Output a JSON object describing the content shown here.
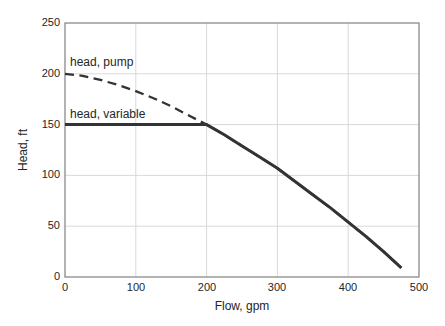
{
  "chart_data": {
    "type": "line",
    "title": "",
    "xlabel": "Flow, gpm",
    "ylabel": "Head, ft",
    "xlim": [
      0,
      500
    ],
    "ylim": [
      0,
      250
    ],
    "xticks": [
      0,
      100,
      200,
      300,
      400,
      500
    ],
    "yticks": [
      0,
      50,
      100,
      150,
      200,
      250
    ],
    "grid": true,
    "legend_position": "none",
    "colors": {
      "line": "#333333",
      "grid": "#d9d9d9",
      "frame": "#808080",
      "text": "#262626",
      "background": "#ffffff"
    },
    "series": [
      {
        "name": "head, pump",
        "style": "dashed",
        "points": [
          [
            0,
            200
          ],
          [
            25,
            198
          ],
          [
            50,
            194
          ],
          [
            75,
            189
          ],
          [
            100,
            183
          ],
          [
            125,
            176
          ],
          [
            150,
            168
          ],
          [
            175,
            159
          ],
          [
            200,
            150
          ],
          [
            225,
            140
          ],
          [
            250,
            129
          ],
          [
            275,
            118
          ],
          [
            300,
            107
          ],
          [
            325,
            94
          ],
          [
            350,
            81
          ],
          [
            375,
            68
          ],
          [
            400,
            54
          ],
          [
            425,
            40
          ],
          [
            450,
            25
          ],
          [
            475,
            9
          ]
        ]
      },
      {
        "name": "head, variable",
        "style": "solid",
        "points": [
          [
            0,
            150
          ],
          [
            50,
            150
          ],
          [
            100,
            150
          ],
          [
            150,
            150
          ],
          [
            200,
            150
          ],
          [
            225,
            140
          ],
          [
            250,
            129
          ],
          [
            275,
            118
          ],
          [
            300,
            107
          ],
          [
            325,
            94
          ],
          [
            350,
            81
          ],
          [
            375,
            68
          ],
          [
            400,
            54
          ],
          [
            425,
            40
          ],
          [
            450,
            25
          ],
          [
            475,
            9
          ]
        ]
      }
    ],
    "annotations": [
      {
        "text": "head, pump",
        "x": 7,
        "y": 205
      },
      {
        "text": "head, variable",
        "x": 7,
        "y": 153
      }
    ]
  }
}
